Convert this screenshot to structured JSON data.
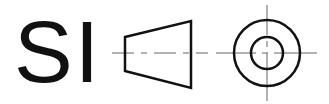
{
  "symbol": {
    "label": "SI",
    "description": "First-angle projection symbol",
    "colors": {
      "stroke": "#111111",
      "centerline": "#555555",
      "background": "#ffffff"
    }
  }
}
